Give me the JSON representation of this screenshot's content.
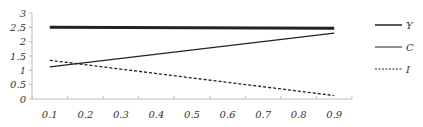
{
  "chart_data": {
    "type": "line",
    "title": "",
    "xlabel": "",
    "ylabel": "",
    "categories": [
      "0.1",
      "0.2",
      "0.3",
      "0.4",
      "0.5",
      "0.6",
      "0.7",
      "0.8",
      "0.9"
    ],
    "x": [
      0.1,
      0.9
    ],
    "series": [
      {
        "name": "Y",
        "style": "thick-solid",
        "x": [
          0.1,
          0.9
        ],
        "values": [
          2.5,
          2.47
        ]
      },
      {
        "name": "C",
        "style": "solid",
        "x": [
          0.1,
          0.9
        ],
        "values": [
          1.12,
          2.3
        ]
      },
      {
        "name": "I",
        "style": "dashed",
        "x": [
          0.1,
          0.9
        ],
        "values": [
          1.35,
          0.12
        ]
      }
    ],
    "ylim": [
      0,
      3
    ],
    "yticks": [
      "0",
      "0.5",
      "1",
      "1.5",
      "2",
      "2.5",
      "3"
    ],
    "grid": false,
    "legend_position": "right"
  },
  "legend": [
    {
      "label": "Y"
    },
    {
      "label": "C"
    },
    {
      "label": "I"
    }
  ]
}
